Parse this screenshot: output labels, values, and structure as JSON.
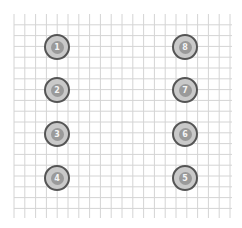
{
  "diagram": {
    "title": "",
    "grid": {
      "x0": 14,
      "y0": 14,
      "x1": 231,
      "y1": 218,
      "spacing": 10.8,
      "line_color": "#d4d4d4"
    },
    "pin_colors": {
      "ring": "#555555",
      "fill": "#c9c9c9",
      "inner": "#9a9a9a",
      "label": "#f4f4f4"
    },
    "pins": [
      {
        "label": "1",
        "cx": 57,
        "cy": 47
      },
      {
        "label": "2",
        "cx": 57,
        "cy": 90
      },
      {
        "label": "3",
        "cx": 57,
        "cy": 134
      },
      {
        "label": "4",
        "cx": 57,
        "cy": 178
      },
      {
        "label": "5",
        "cx": 185,
        "cy": 178
      },
      {
        "label": "6",
        "cx": 185,
        "cy": 134
      },
      {
        "label": "7",
        "cx": 185,
        "cy": 90
      },
      {
        "label": "8",
        "cx": 185,
        "cy": 47
      }
    ]
  }
}
